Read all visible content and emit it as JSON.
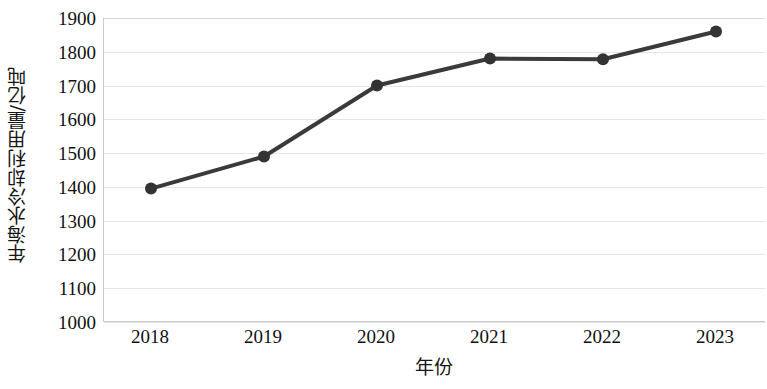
{
  "chart_data": {
    "type": "line",
    "title": "",
    "subtitle": "",
    "xlabel": "年份",
    "ylabel": "年海水冷却利用量/亿吨",
    "categories": [
      "2018",
      "2019",
      "2020",
      "2021",
      "2022",
      "2023"
    ],
    "x": [
      2018,
      2019,
      2020,
      2021,
      2022,
      2023
    ],
    "values": [
      1395,
      1490,
      1700,
      1780,
      1778,
      1860
    ],
    "series": [
      {
        "name": "年海水冷却利用量",
        "values": [
          1395,
          1490,
          1700,
          1780,
          1778,
          1860
        ]
      }
    ],
    "ylim": [
      1000,
      1900
    ],
    "ytick_labels": [
      "1900",
      "1800",
      "1700",
      "1600",
      "1500",
      "1400",
      "1300",
      "1200",
      "1100",
      "1000"
    ],
    "ytick_values": [
      1900,
      1800,
      1700,
      1600,
      1500,
      1400,
      1300,
      1200,
      1100,
      1000
    ],
    "ytick_step": 100,
    "xlim": [
      "2018",
      "2023"
    ],
    "grid": true,
    "grid_axis": "y",
    "legend": false,
    "legend_position": "none",
    "marker": "circle",
    "marker_size": 9,
    "line_width": 4,
    "annotations": [],
    "colors": {
      "line": "#3a3a3a",
      "marker": "#333333",
      "grid": "#e6e6e6",
      "axis": "#c9c9c9",
      "text": "#111111",
      "background": "#ffffff"
    }
  }
}
